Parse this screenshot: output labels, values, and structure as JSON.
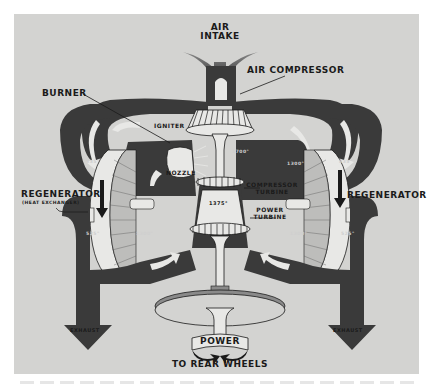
{
  "diagram": {
    "labels": {
      "air_intake_line1": "AIR",
      "air_intake_line2": "INTAKE",
      "air_compressor": "AIR COMPRESSOR",
      "burner": "BURNER",
      "igniter": "IGNITER",
      "nozzle": "NOZZLE",
      "regenerator_left": "REGENERATOR",
      "regenerator_left_sub": "(HEAT EXCHANGER)",
      "regenerator_right": "REGENERATOR",
      "compressor_turbine_line1": "COMPRESSOR",
      "compressor_turbine_line2": "TURBINE",
      "power_turbine_line1": "POWER",
      "power_turbine_line2": "TURBINE",
      "exhaust_left": "EXHAUST",
      "exhaust_right": "EXHAUST",
      "power": "POWER",
      "to_rear_wheels": "TO REAR WHEELS"
    },
    "temperatures": {
      "left_upper": "835°",
      "right_upper": "835°",
      "center_upper_left": "1700°",
      "center_upper_right": "1300°",
      "turbine_center": "1375°",
      "left_lower": "525°",
      "right_lower": "525°",
      "center_lower_left": "1300°",
      "center_lower_right": "1300°"
    },
    "colors": {
      "background": "#ffffff",
      "panel": "#d3d3d1",
      "duct_dark": "#3a3a3a",
      "part_light": "#e8e8e6",
      "outline": "#1a1a1a"
    }
  }
}
